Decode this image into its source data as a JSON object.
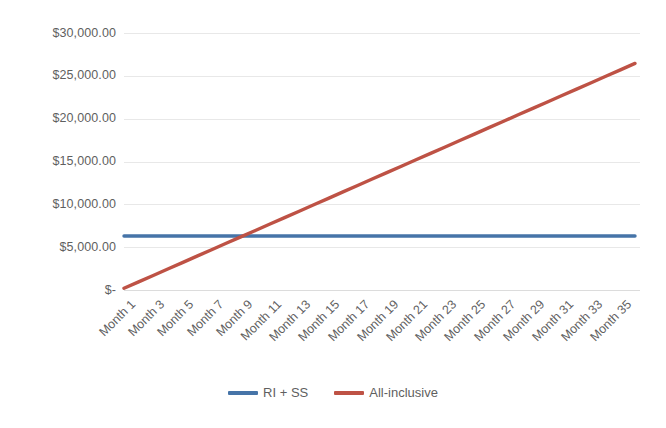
{
  "chart_data": {
    "type": "line",
    "title": "",
    "subtitle": "",
    "xlabel": "",
    "ylabel": "",
    "grid": true,
    "legend_position": "bottom",
    "ylim": [
      0,
      30000
    ],
    "y_ticks": [
      0,
      5000,
      10000,
      15000,
      20000,
      25000,
      30000
    ],
    "y_tick_labels": [
      "$-",
      "$5,000.00",
      "$10,000.00",
      "$15,000.00",
      "$20,000.00",
      "$25,000.00",
      "$30,000.00"
    ],
    "x": [
      1,
      2,
      3,
      4,
      5,
      6,
      7,
      8,
      9,
      10,
      11,
      12,
      13,
      14,
      15,
      16,
      17,
      18,
      19,
      20,
      21,
      22,
      23,
      24,
      25,
      26,
      27,
      28,
      29,
      30,
      31,
      32,
      33,
      34,
      35,
      36
    ],
    "categories": [
      "Month 1",
      "Month 2",
      "Month 3",
      "Month 4",
      "Month 5",
      "Month 6",
      "Month 7",
      "Month 8",
      "Month 9",
      "Month 10",
      "Month 11",
      "Month 12",
      "Month 13",
      "Month 14",
      "Month 15",
      "Month 16",
      "Month 17",
      "Month 18",
      "Month 19",
      "Month 20",
      "Month 21",
      "Month 22",
      "Month 23",
      "Month 24",
      "Month 25",
      "Month 26",
      "Month 27",
      "Month 28",
      "Month 29",
      "Month 30",
      "Month 31",
      "Month 32",
      "Month 33",
      "Month 34",
      "Month 35",
      "Month 36"
    ],
    "x_tick_labels": [
      "Month 1",
      "Month 3",
      "Month 5",
      "Month 7",
      "Month 9",
      "Month 11",
      "Month 13",
      "Month 15",
      "Month 17",
      "Month 19",
      "Month 21",
      "Month 23",
      "Month 25",
      "Month 27",
      "Month 29",
      "Month 31",
      "Month 33",
      "Month 35"
    ],
    "series": [
      {
        "name": "RI + SS",
        "color": "#4674A8",
        "values": [
          6300,
          6300,
          6300,
          6300,
          6300,
          6300,
          6300,
          6300,
          6300,
          6300,
          6300,
          6300,
          6300,
          6300,
          6300,
          6300,
          6300,
          6300,
          6300,
          6300,
          6300,
          6300,
          6300,
          6300,
          6300,
          6300,
          6300,
          6300,
          6300,
          6300,
          6300,
          6300,
          6300,
          6300,
          6300,
          6300
        ]
      },
      {
        "name": "All-inclusive",
        "color": "#BE5245",
        "values": [
          200,
          950,
          1700,
          2450,
          3200,
          3950,
          4700,
          5450,
          6200,
          6950,
          7700,
          8450,
          9200,
          9950,
          10700,
          11450,
          12200,
          12950,
          13700,
          14450,
          15200,
          15950,
          16700,
          17450,
          18200,
          18950,
          19700,
          20450,
          21200,
          21950,
          22700,
          23450,
          24200,
          24950,
          25700,
          26450
        ]
      }
    ]
  },
  "legend": {
    "entries": [
      {
        "label": "RI + SS",
        "color": "#4674A8"
      },
      {
        "label": "All-inclusive",
        "color": "#BE5245"
      }
    ]
  }
}
